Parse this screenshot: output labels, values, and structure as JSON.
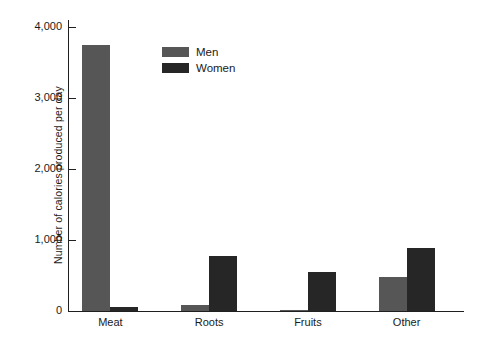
{
  "chart_data": {
    "type": "bar",
    "title": "",
    "subtitle": "",
    "xlabel": "",
    "ylabel": "Number of calories produced per day",
    "categories": [
      "Meat",
      "Roots",
      "Fruits",
      "Other"
    ],
    "series": [
      {
        "name": "Men",
        "color": "#565656",
        "values": [
          3750,
          80,
          15,
          480
        ]
      },
      {
        "name": "Women",
        "color": "#262626",
        "values": [
          50,
          775,
          550,
          890
        ]
      }
    ],
    "ylim": [
      0,
      4000
    ],
    "ytick_values": [
      0,
      1000,
      2000,
      3000,
      4000
    ],
    "ytick_labels": [
      "0",
      "1,000",
      "2,000",
      "3,000",
      "4,000"
    ],
    "grid": false,
    "legend_position": "upper-center",
    "legend_entries": [
      "Men",
      "Women"
    ],
    "background_color": "#ffffff",
    "axis_color": "#1f1f1f"
  }
}
